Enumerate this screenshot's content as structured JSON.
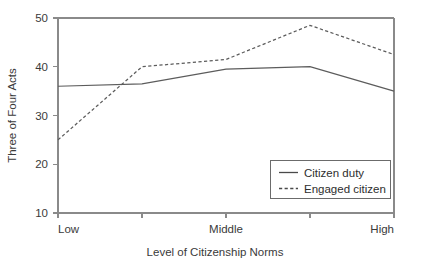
{
  "chart_data": {
    "type": "line",
    "title": "",
    "xlabel": "Level of Citizenship Norms",
    "ylabel": "Three of Four Acts",
    "categories": [
      "Low",
      "",
      "Middle",
      "",
      "High"
    ],
    "x_tick_labels": [
      "Low",
      "Middle",
      "High"
    ],
    "y_tick_labels": [
      "10",
      "20",
      "30",
      "40",
      "50"
    ],
    "y_ticks": [
      10,
      20,
      30,
      40,
      50
    ],
    "ylim": [
      10,
      50
    ],
    "xlim": [
      0,
      4
    ],
    "grid": false,
    "legend_position": "bottom-right",
    "series": [
      {
        "name": "Citizen duty",
        "style": "solid",
        "color": "#5c5c5c",
        "values": [
          36.0,
          36.5,
          39.5,
          40.0,
          35.0
        ]
      },
      {
        "name": "Engaged citizen",
        "style": "dashed",
        "color": "#5c5c5c",
        "values": [
          25.0,
          40.0,
          41.5,
          48.5,
          42.5
        ]
      }
    ]
  },
  "axes": {
    "y_title": "Three of Four Acts",
    "x_title": "Level of Citizenship Norms",
    "y_labels": {
      "t50": "50",
      "t40": "40",
      "t30": "30",
      "t20": "20",
      "t10": "10"
    },
    "x_labels": {
      "low": "Low",
      "middle": "Middle",
      "high": "High"
    }
  },
  "legend": {
    "entries": [
      {
        "label": "Citizen duty",
        "style": "solid"
      },
      {
        "label": "Engaged citizen",
        "style": "dashed"
      }
    ],
    "item_0_label": "Citizen duty",
    "item_1_label": "Engaged citizen"
  }
}
